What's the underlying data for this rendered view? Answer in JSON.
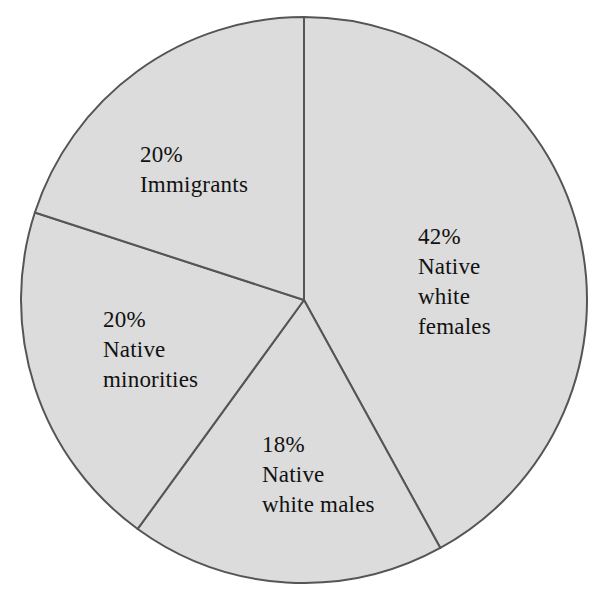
{
  "chart_data": {
    "type": "pie",
    "title": "",
    "subtitle": "",
    "xlabel": "",
    "ylabel": "",
    "legend_position": "none",
    "grid": false,
    "units": "percent",
    "total": 100,
    "categories": [
      "Native white females",
      "Native white males",
      "Native minorities",
      "Immigrants"
    ],
    "values": [
      42,
      18,
      20,
      20
    ],
    "slices": [
      {
        "id": "native-white-females",
        "percent": 42,
        "percent_label": "42%",
        "name_lines": [
          "Native",
          "white",
          "females"
        ],
        "start_angle_deg": 0,
        "end_angle_deg": 151.2
      },
      {
        "id": "native-white-males",
        "percent": 18,
        "percent_label": "18%",
        "name_lines": [
          "Native",
          "white males"
        ],
        "start_angle_deg": 151.2,
        "end_angle_deg": 216.0
      },
      {
        "id": "native-minorities",
        "percent": 20,
        "percent_label": "20%",
        "name_lines": [
          "Native",
          "minorities"
        ],
        "start_angle_deg": 216.0,
        "end_angle_deg": 288.0
      },
      {
        "id": "immigrants",
        "percent": 20,
        "percent_label": "20%",
        "name_lines": [
          "Immigrants"
        ],
        "start_angle_deg": 288.0,
        "end_angle_deg": 360.0
      }
    ]
  },
  "labels": {
    "native_white_females": {
      "line1": "42%",
      "line2": "Native",
      "line3": "white",
      "line4": "females"
    },
    "native_white_males": {
      "line1": "18%",
      "line2": "Native",
      "line3": "white males"
    },
    "native_minorities": {
      "line1": "20%",
      "line2": "Native",
      "line3": "minorities"
    },
    "immigrants": {
      "line1": "20%",
      "line2": "Immigrants"
    }
  },
  "colors": {
    "slice_fill": "#dcdcdc",
    "slice_stroke": "#555555",
    "text": "#111111",
    "background": "#ffffff"
  },
  "geometry": {
    "center_x": 304,
    "center_y": 300,
    "radius": 283
  }
}
